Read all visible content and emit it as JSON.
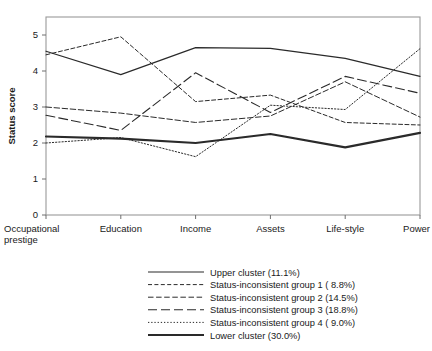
{
  "chart_data": {
    "type": "line",
    "title": "",
    "xlabel": "",
    "ylabel": "Status score",
    "categories": [
      "Occupational prestige",
      "Education",
      "Income",
      "Assets",
      "Life-style",
      "Power"
    ],
    "category_lines": [
      [
        "Occupational",
        "prestige"
      ],
      [
        "Education"
      ],
      [
        "Income"
      ],
      [
        "Assets"
      ],
      [
        "Life-style"
      ],
      [
        "Power"
      ]
    ],
    "ylim": [
      0,
      5.5
    ],
    "yticks": [
      0,
      1,
      2,
      3,
      4,
      5
    ],
    "ytick_labels": [
      "0",
      "1",
      "2",
      "3",
      "4",
      "5"
    ],
    "grid": false,
    "legend_position": "below",
    "series": [
      {
        "name": "Upper cluster (11.1%)",
        "label": "Upper cluster (11.1%)",
        "style": "solid-thin",
        "values": [
          4.55,
          3.9,
          4.65,
          4.63,
          4.35,
          3.85
        ]
      },
      {
        "name": "Status-inconsistent group 1 (  8.8%)",
        "label": "Status-inconsistent group 1 (  8.8%)",
        "style": "dotted-dash",
        "values": [
          4.45,
          4.95,
          3.15,
          3.33,
          2.57,
          2.5
        ]
      },
      {
        "name": "Status-inconsistent group 2 (14.5%)",
        "label": "Status-inconsistent group 2 (14.5%)",
        "style": "dashed-short",
        "values": [
          3.0,
          2.83,
          2.57,
          2.75,
          3.7,
          2.72
        ]
      },
      {
        "name": "Status-inconsistent group 3 (18.8%)",
        "label": "Status-inconsistent group 3 (18.8%)",
        "style": "dashed-long",
        "values": [
          2.77,
          2.35,
          3.95,
          2.85,
          3.85,
          3.38
        ]
      },
      {
        "name": "Status-inconsistent group 4 (  9.0%)",
        "label": "Status-inconsistent group 4 (  9.0%)",
        "style": "dotted",
        "values": [
          2.0,
          2.15,
          1.62,
          3.05,
          2.93,
          4.62
        ]
      },
      {
        "name": "Lower cluster (30.0%)",
        "label": "Lower cluster (30.0%)",
        "style": "solid-thick",
        "values": [
          2.18,
          2.12,
          2.0,
          2.25,
          1.88,
          2.28
        ]
      }
    ]
  }
}
